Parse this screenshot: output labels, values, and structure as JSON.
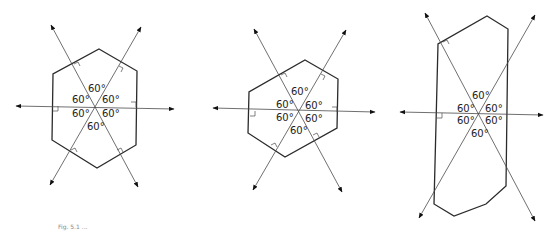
{
  "figures": [
    {
      "id": "regular-hexagon",
      "angles": [
        "60°",
        "60°",
        "60°",
        "60°",
        "60°",
        "60°"
      ]
    },
    {
      "id": "rotated-hexagon",
      "angles": [
        "60°",
        "60°",
        "60°",
        "60°",
        "60°",
        "60°"
      ]
    },
    {
      "id": "elongated-hexagon",
      "angles": [
        "60°",
        "60°",
        "60°",
        "60°",
        "60°",
        "60°"
      ]
    }
  ],
  "caption": "Fig. 5.1 ..."
}
